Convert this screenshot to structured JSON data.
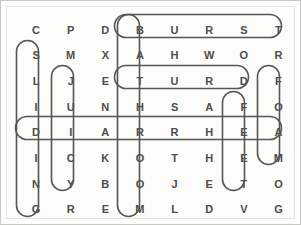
{
  "puzzle": {
    "type": "word-search",
    "rows": 8,
    "columns": 8,
    "ink_color": "#4c4c4c",
    "mark_color": "#555555",
    "background_color": "#fdfdfb",
    "border_color": "#c9c9c4",
    "grid": [
      [
        "C",
        "P",
        "D",
        "B",
        "U",
        "R",
        "S",
        "T"
      ],
      [
        "S",
        "M",
        "X",
        "A",
        "H",
        "W",
        "O",
        "R"
      ],
      [
        "L",
        "J",
        "E",
        "T",
        "U",
        "R",
        "D",
        "F"
      ],
      [
        "I",
        "U",
        "N",
        "H",
        "S",
        "A",
        "F",
        "O"
      ],
      [
        "D",
        "I",
        "A",
        "R",
        "R",
        "H",
        "E",
        "A"
      ],
      [
        "I",
        "C",
        "K",
        "O",
        "T",
        "H",
        "E",
        "M"
      ],
      [
        "N",
        "Y",
        "B",
        "O",
        "J",
        "E",
        "T",
        "O"
      ],
      [
        "G",
        "R",
        "E",
        "M",
        "L",
        "D",
        "V",
        "G"
      ]
    ],
    "found_words": [
      {
        "word": "BURST",
        "direction": "horizontal",
        "row": 1,
        "start_column": 4,
        "end_column": 8,
        "letters": [
          "B",
          "U",
          "R",
          "S",
          "T"
        ]
      },
      {
        "word": "TURD",
        "direction": "horizontal",
        "row": 3,
        "start_column": 4,
        "end_column": 7,
        "letters": [
          "T",
          "U",
          "R",
          "D"
        ]
      },
      {
        "word": "DIARRHEA",
        "direction": "horizontal",
        "row": 5,
        "start_column": 1,
        "end_column": 8,
        "letters": [
          "D",
          "I",
          "A",
          "R",
          "R",
          "H",
          "E",
          "A"
        ]
      },
      {
        "word": "SLIDING",
        "direction": "vertical",
        "column": 1,
        "start_row": 2,
        "end_row": 8,
        "letters": [
          "S",
          "L",
          "I",
          "D",
          "I",
          "N",
          "G"
        ]
      },
      {
        "word": "JUICY",
        "direction": "vertical",
        "column": 2,
        "start_row": 3,
        "end_row": 7,
        "letters": [
          "J",
          "U",
          "I",
          "C",
          "Y"
        ]
      },
      {
        "word": "BATHROOM",
        "direction": "vertical",
        "column": 4,
        "start_row": 1,
        "end_row": 8,
        "letters": [
          "B",
          "A",
          "T",
          "H",
          "R",
          "O",
          "O",
          "M"
        ]
      },
      {
        "word": "FEET",
        "direction": "vertical",
        "column": 7,
        "start_row": 4,
        "end_row": 7,
        "letters": [
          "F",
          "E",
          "E",
          "T"
        ]
      },
      {
        "word": "FOAM",
        "direction": "vertical",
        "column": 8,
        "start_row": 3,
        "end_row": 6,
        "letters": [
          "F",
          "O",
          "A",
          "M"
        ]
      }
    ]
  }
}
